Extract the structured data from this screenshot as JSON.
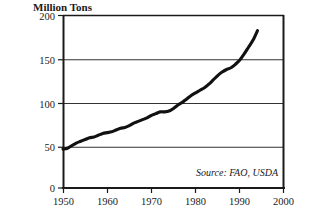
{
  "chart_data": {
    "type": "line",
    "title": "",
    "ylabel": "Million Tons",
    "xlabel": "",
    "xlim": [
      1950,
      2000
    ],
    "ylim": [
      0,
      200
    ],
    "grid": true,
    "legend": null,
    "annotations": [
      {
        "name": "source-note",
        "text": "Source: FAO, USDA"
      }
    ],
    "y_ticks": [
      {
        "value": 0,
        "label": "0"
      },
      {
        "value": 50,
        "label": "50"
      },
      {
        "value": 100,
        "label": "100"
      },
      {
        "value": 150,
        "label": "150"
      },
      {
        "value": 200,
        "label": "200"
      }
    ],
    "x_ticks": [
      {
        "value": 1950,
        "label": "1950"
      },
      {
        "value": 1960,
        "label": "1960"
      },
      {
        "value": 1970,
        "label": "1970"
      },
      {
        "value": 1980,
        "label": "1980"
      },
      {
        "value": 1990,
        "label": "1990"
      },
      {
        "value": 2000,
        "label": "2000"
      }
    ],
    "series": [
      {
        "name": "World Meat Production",
        "color": "#111111",
        "x": [
          1950,
          1951,
          1952,
          1953,
          1954,
          1955,
          1956,
          1957,
          1958,
          1959,
          1960,
          1961,
          1962,
          1963,
          1964,
          1965,
          1966,
          1967,
          1968,
          1969,
          1970,
          1971,
          1972,
          1973,
          1974,
          1975,
          1976,
          1977,
          1978,
          1979,
          1980,
          1981,
          1982,
          1983,
          1984,
          1985,
          1986,
          1987,
          1988,
          1989,
          1990,
          1991,
          1992,
          1993,
          1994
        ],
        "values": [
          45,
          46,
          49,
          52,
          54,
          56,
          58,
          59,
          61,
          63,
          64,
          65,
          67,
          69,
          70,
          72,
          75,
          77,
          79,
          81,
          84,
          86,
          88,
          88,
          89,
          92,
          96,
          99,
          103,
          107,
          110,
          113,
          116,
          120,
          125,
          130,
          134,
          137,
          139,
          143,
          148,
          155,
          163,
          171,
          182
        ]
      }
    ]
  },
  "plot_geometry": {
    "left": 63,
    "right": 284,
    "top": 15,
    "bottom": 188
  }
}
